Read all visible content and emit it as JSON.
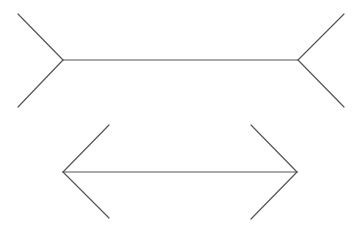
{
  "diagram": {
    "title": "",
    "background": "#ffffff",
    "stroke_color": "#555555",
    "stroke_width": 1.2,
    "figures": [
      {
        "name": "fins-out",
        "shaft": {
          "x1": 63,
          "y1": 60,
          "x2": 298,
          "y2": 60
        },
        "fins": [
          {
            "x1": 63,
            "y1": 60,
            "x2": 18,
            "y2": 14
          },
          {
            "x1": 63,
            "y1": 60,
            "x2": 18,
            "y2": 107
          },
          {
            "x1": 298,
            "y1": 60,
            "x2": 344,
            "y2": 14
          },
          {
            "x1": 298,
            "y1": 60,
            "x2": 344,
            "y2": 107
          }
        ]
      },
      {
        "name": "fins-in",
        "shaft": {
          "x1": 63,
          "y1": 172,
          "x2": 297,
          "y2": 172
        },
        "fins": [
          {
            "x1": 63,
            "y1": 172,
            "x2": 109,
            "y2": 125
          },
          {
            "x1": 63,
            "y1": 172,
            "x2": 109,
            "y2": 218
          },
          {
            "x1": 297,
            "y1": 172,
            "x2": 251,
            "y2": 125
          },
          {
            "x1": 297,
            "y1": 172,
            "x2": 251,
            "y2": 219
          }
        ]
      }
    ]
  }
}
